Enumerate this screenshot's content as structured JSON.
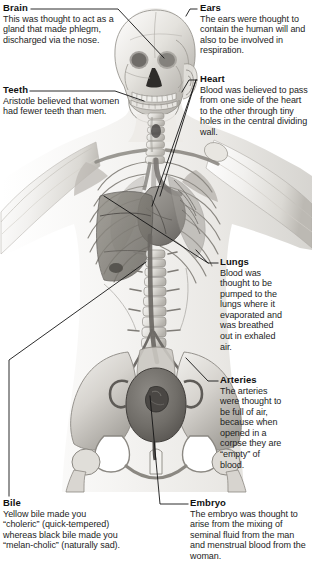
{
  "figure": {
    "name": "human-anatomy-illustration",
    "palette": {
      "background": "#ffffff",
      "ink": "#1b1b1b",
      "leader_line": "#1a1a1a",
      "bone_light": "#efeeec",
      "bone_mid": "#cfcdc9",
      "bone_shadow": "#a8a5a0",
      "organ_mid": "#9a9792",
      "organ_dark": "#6e6b67",
      "skin_tint": "#f6f5f3"
    }
  },
  "callouts": [
    {
      "id": "brain",
      "heading": "Brain",
      "body": "This was thought to act as a gland that made phlegm, discharged via the nose."
    },
    {
      "id": "teeth",
      "heading": "Teeth",
      "body": "Aristotle believed that women had fewer teeth than men."
    },
    {
      "id": "ears",
      "heading": "Ears",
      "body": "The ears were thought to contain the human will and also to be involved in respiration."
    },
    {
      "id": "heart",
      "heading": "Heart",
      "body": "Blood was believed to pass from one side of the heart to the other through tiny holes in the central dividing wall."
    },
    {
      "id": "lungs",
      "heading": "Lungs",
      "body": "Blood was thought to be pumped to the lungs where it evaporated and was breathed out in exhaled air."
    },
    {
      "id": "arteries",
      "heading": "Arteries",
      "body": "The arteries were thought to be full of air, because when opened in a corpse they are “empty” of blood."
    },
    {
      "id": "bile",
      "heading": "Bile",
      "body": "Yellow bile made you “choleric” (quick-tempered) whereas black bile made you “melan-cholic” (naturally sad)."
    },
    {
      "id": "embryo",
      "heading": "Embryo",
      "body": "The embryo was thought to arise from the mixing of seminal fluid from the man and menstrual blood from the woman."
    }
  ]
}
